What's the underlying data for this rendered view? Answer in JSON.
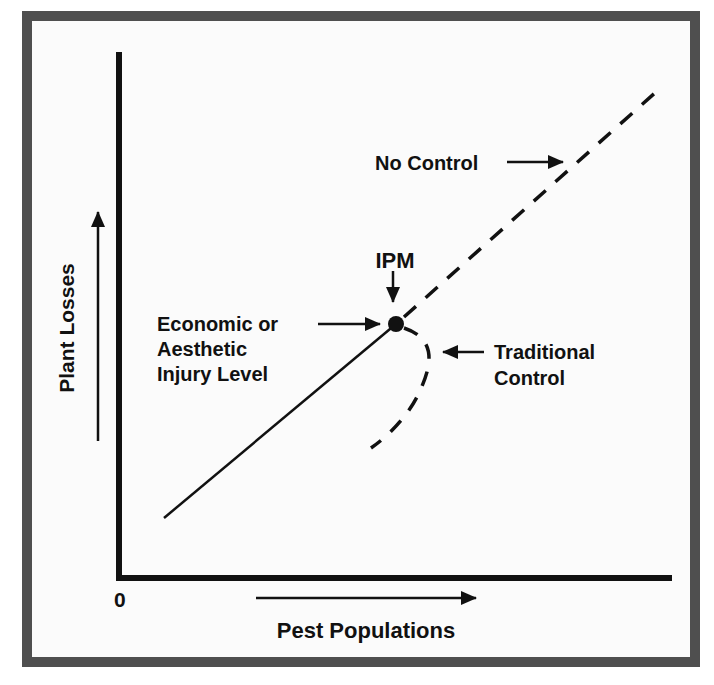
{
  "diagram": {
    "type": "ipm-concept-graph",
    "colors": {
      "frame": "#4f4f4f",
      "background": "#fbfbfb",
      "ink": "#111111"
    },
    "axes": {
      "y_label": "Plant Losses",
      "x_label": "Pest Populations",
      "origin_label": "0"
    },
    "labels": {
      "no_control": "No Control",
      "ipm": "IPM",
      "injury_level_line1": "Economic or",
      "injury_level_line2": "Aesthetic",
      "injury_level_line3": "Injury Level",
      "traditional_line1": "Traditional",
      "traditional_line2": "Control"
    },
    "curves": [
      {
        "name": "baseline",
        "style": "solid",
        "from": "low pest / low loss",
        "to": "injury level point"
      },
      {
        "name": "No Control",
        "style": "dashed",
        "trend": "losses continue rising with pest population"
      },
      {
        "name": "Traditional Control",
        "style": "dashed",
        "trend": "curves back down after injury level"
      },
      {
        "name": "IPM",
        "style": "point",
        "marker": "dot at economic injury level"
      }
    ]
  }
}
